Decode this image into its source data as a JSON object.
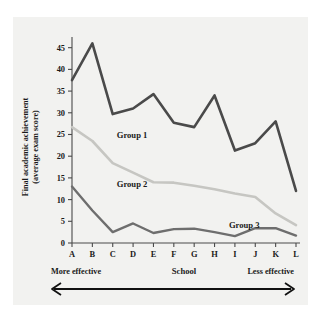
{
  "chart_data": {
    "type": "line",
    "title": "",
    "xlabel": "School",
    "ylabel": "Final academic achievement\n(average exam score)",
    "ylabel_line1": "Final academic achievement",
    "ylabel_line2": "(average exam score)",
    "categories": [
      "A",
      "B",
      "C",
      "D",
      "E",
      "F",
      "G",
      "H",
      "I",
      "J",
      "K",
      "L"
    ],
    "ylim": [
      0,
      47
    ],
    "yticks": [
      0,
      5,
      10,
      15,
      20,
      25,
      30,
      35,
      40,
      45
    ],
    "ytick_labels": [
      "0",
      "5",
      "10",
      "15",
      "20",
      "25",
      "30",
      "35",
      "40",
      "45"
    ],
    "grid": false,
    "legend_position": "inline-annotations",
    "series": [
      {
        "name": "Group 1",
        "color": "#4a4a4a",
        "label_x_category": "C",
        "values": [
          37.5,
          46.0,
          29.7,
          31.0,
          34.3,
          27.7,
          26.7,
          34.0,
          21.3,
          23.0,
          28.0,
          12.0
        ]
      },
      {
        "name": "Group 2",
        "color": "#c6c6c2",
        "label_x_category": "C",
        "values": [
          26.7,
          23.5,
          18.4,
          16.2,
          14.0,
          13.9,
          13.2,
          12.4,
          11.4,
          10.6,
          6.8,
          4.1
        ]
      },
      {
        "name": "Group 3",
        "color": "#6e6e6e",
        "label_x_category": "I",
        "values": [
          13.0,
          7.5,
          2.5,
          4.5,
          2.3,
          3.2,
          3.3,
          2.5,
          1.6,
          3.4,
          3.4,
          1.7
        ]
      }
    ],
    "annotations": [
      {
        "name": "more-effective",
        "text": "More effective",
        "position": "bottom-left"
      },
      {
        "name": "less-effective",
        "text": "Less effective",
        "position": "bottom-right"
      }
    ]
  }
}
